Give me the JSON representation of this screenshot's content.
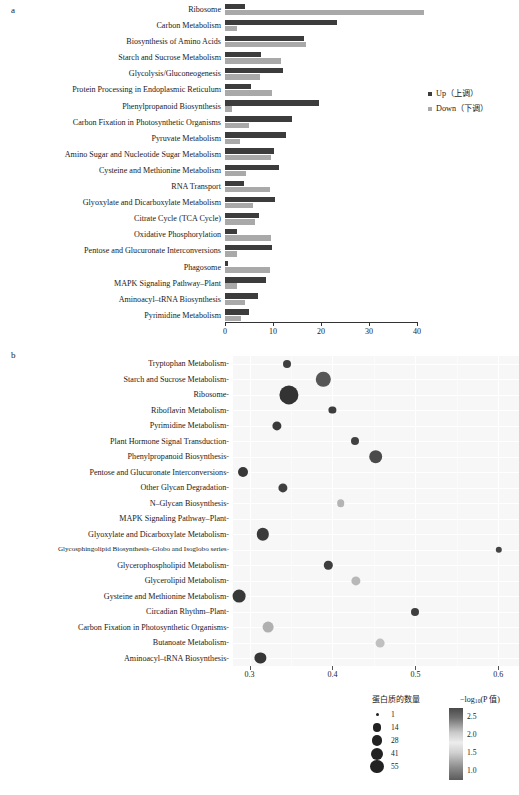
{
  "panels": {
    "a_letter": "a",
    "b_letter": "b"
  },
  "panel_a": {
    "legend": [
      {
        "key": "up",
        "label": "Up（上调）",
        "color": "#3c3c3c"
      },
      {
        "key": "down",
        "label": "Down（下调）",
        "color": "#a9a9a9"
      }
    ],
    "axis": {
      "ticks": [
        0,
        10,
        20,
        30,
        40
      ],
      "min": 0,
      "max": 40
    }
  },
  "panel_b": {
    "axis": {
      "ticks": [
        "0.3",
        "0.4",
        "0.5",
        "0.6"
      ],
      "min": 0.28,
      "max": 0.625
    },
    "size_legend": {
      "title": "蛋白质的数量",
      "entries": [
        {
          "label": "1",
          "value": 1,
          "px": 2.0
        },
        {
          "label": "14",
          "value": 14,
          "px": 5.6
        },
        {
          "label": "28",
          "value": 28,
          "px": 7.0
        },
        {
          "label": "41",
          "value": 41,
          "px": 8.0
        },
        {
          "label": "55",
          "value": 55,
          "px": 9.0
        }
      ]
    },
    "color_legend": {
      "title_prefix": "−log",
      "title_sub": "10",
      "title_suffix": "(P 值)",
      "ticks": [
        "2.5",
        "2.0",
        "1.5",
        "1.0"
      ],
      "range": [
        1.0,
        2.5
      ]
    }
  },
  "chart_data": [
    {
      "type": "bar",
      "orientation": "horizontal",
      "title": "",
      "xlabel": "",
      "ylabel": "",
      "xlim": [
        0,
        40
      ],
      "xticks": [
        0,
        10,
        20,
        30,
        40
      ],
      "grid": false,
      "legend": [
        "Up（上调）",
        "Down（下调）"
      ],
      "legend_position": "right",
      "categories": [
        "Ribosome",
        "Carbon Metabolism",
        "Biosynthesis of Amino Acids",
        "Starch and Sucrose Metabolism",
        "Glycolysis/Gluconeogenesis",
        "Protein Processing in Endoplasmic Reticulum",
        "Phenylpropanoid Biosynthesis",
        "Carbon Fixation in Photosynthetic Organisms",
        "Pyruvate Metabolism",
        "Amino Sugar and Nucleotide Sugar Metabolism",
        "Cysteine and Methionine Metabolism",
        "RNA Transport",
        "Glyoxylate and Dicarboxylate Metabolism",
        "Citrate Cycle (TCA Cycle)",
        "Oxidative Phosphorylation",
        "Pentose and Glucuronate Interconversions",
        "Phagosome",
        "MAPK Signaling Pathway–Plant",
        "Aminoacyl–tRNA Biosynthesis",
        "Pyrimidine Metabolism"
      ],
      "series": [
        {
          "name": "Up（上调）",
          "color": "#3c3c3c",
          "values": [
            4.2,
            23.3,
            16.5,
            7.6,
            12.0,
            5.4,
            19.6,
            14.0,
            12.8,
            10.2,
            11.2,
            4.0,
            10.4,
            7.0,
            2.4,
            9.7,
            0.6,
            8.6,
            6.8,
            5.0
          ]
        },
        {
          "name": "Down（下调）",
          "color": "#a9a9a9",
          "values": [
            41.5,
            2.4,
            16.8,
            11.6,
            7.3,
            9.8,
            1.4,
            5.0,
            3.2,
            9.6,
            4.4,
            9.3,
            5.9,
            6.2,
            9.6,
            2.5,
            9.4,
            2.4,
            4.1,
            3.3
          ]
        }
      ]
    },
    {
      "type": "scatter",
      "variant": "bubble-dotplot",
      "title": "",
      "xlabel": "",
      "ylabel": "",
      "xlim": [
        0.28,
        0.625
      ],
      "xticks": [
        0.3,
        0.4,
        0.5,
        0.6
      ],
      "grid": true,
      "size_legend_title": "蛋白质的数量",
      "color_legend_title": "−log10(P 值)",
      "color_range": [
        1.0,
        2.5
      ],
      "size_range": [
        1,
        55
      ],
      "points": [
        {
          "category": "Tryptophan Metabolism",
          "x": 0.345,
          "count": 8,
          "neglog10p": 2.3,
          "px": 4.0,
          "color": "#3f3f3f"
        },
        {
          "category": "Starch and Sucrose Metabolism",
          "x": 0.389,
          "count": 30,
          "neglog10p": 2.05,
          "px": 7.2,
          "color": "#565656"
        },
        {
          "category": "Ribosome",
          "x": 0.347,
          "count": 55,
          "neglog10p": 2.45,
          "px": 9.6,
          "color": "#333333"
        },
        {
          "category": "Riboflavin Metabolism",
          "x": 0.4,
          "count": 6,
          "neglog10p": 2.25,
          "px": 3.6,
          "color": "#3d3d3d"
        },
        {
          "category": "Pyrimidine Metabolism",
          "x": 0.333,
          "count": 12,
          "neglog10p": 2.35,
          "px": 4.6,
          "color": "#3a3a3a"
        },
        {
          "category": "Plant Hormone Signal Transduction",
          "x": 0.427,
          "count": 8,
          "neglog10p": 2.2,
          "px": 4.0,
          "color": "#414141"
        },
        {
          "category": "Phenylpropanoid Biosynthesis",
          "x": 0.452,
          "count": 26,
          "neglog10p": 2.1,
          "px": 6.8,
          "color": "#4b4b4b"
        },
        {
          "category": "Pentose and Glucuronate Interconversions",
          "x": 0.292,
          "count": 14,
          "neglog10p": 2.4,
          "px": 5.0,
          "color": "#373737"
        },
        {
          "category": "Other Glycan Degradation",
          "x": 0.34,
          "count": 12,
          "neglog10p": 2.25,
          "px": 4.6,
          "color": "#3f3f3f"
        },
        {
          "category": "N–Glycan Biosynthesis",
          "x": 0.41,
          "count": 7,
          "neglog10p": 1.6,
          "px": 3.8,
          "color": "#b4b4b4"
        },
        {
          "category": "MAPK Signaling Pathway–Plant",
          "x": null,
          "count": null,
          "neglog10p": null,
          "px": 0,
          "color": "none"
        },
        {
          "category": "Glyoxylate and Dicarboxylate Metabolism",
          "x": 0.316,
          "count": 22,
          "neglog10p": 2.3,
          "px": 6.2,
          "color": "#3b3b3b"
        },
        {
          "category": "Glycosphingolipid Biosynthesis–Globo and Isoglobo series",
          "x": 0.601,
          "count": 4,
          "neglog10p": 2.15,
          "px": 3.2,
          "color": "#454545"
        },
        {
          "category": "Glycerophospholipid Metabolism",
          "x": 0.395,
          "count": 10,
          "neglog10p": 2.25,
          "px": 4.2,
          "color": "#3e3e3e"
        },
        {
          "category": "Glycerolipid Metabolism",
          "x": 0.428,
          "count": 12,
          "neglog10p": 1.65,
          "px": 4.6,
          "color": "#b8b8b8"
        },
        {
          "category": "Gysteine and Methionine Metabolism",
          "x": 0.287,
          "count": 24,
          "neglog10p": 2.35,
          "px": 6.4,
          "color": "#383838"
        },
        {
          "category": "Circadian Rhythm–Plant",
          "x": 0.5,
          "count": 8,
          "neglog10p": 2.25,
          "px": 4.0,
          "color": "#3f3f3f"
        },
        {
          "category": "Carbon Fixation in Photosynthetic Organisms",
          "x": 0.322,
          "count": 16,
          "neglog10p": 1.55,
          "px": 5.4,
          "color": "#b0b0b0"
        },
        {
          "category": "Butanoate Metabolism",
          "x": 0.457,
          "count": 10,
          "neglog10p": 1.7,
          "px": 4.4,
          "color": "#c0c0c0"
        },
        {
          "category": "Aminoacyl–tRNA Biosynthesis",
          "x": 0.313,
          "count": 18,
          "neglog10p": 2.4,
          "px": 5.6,
          "color": "#363636"
        }
      ]
    }
  ]
}
